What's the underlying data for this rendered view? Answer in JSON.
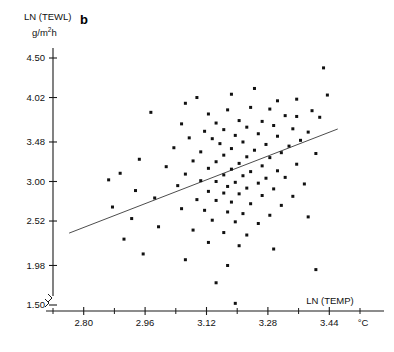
{
  "figure": {
    "panel_label": "b",
    "background_color": "#ffffff",
    "point_color": "#111111",
    "line_color": "#4d4d4d",
    "axis_color": "#1a1a1a"
  },
  "chart_data": {
    "type": "scatter",
    "title": "",
    "subtitle": "",
    "xlabel": "LN (TEMP)",
    "ylabel": "LN (TEWL)",
    "x_units": "°C",
    "y_units": "g/m²h",
    "y_units_base": "g/m",
    "y_units_exponent": "2",
    "y_units_suffix": "h",
    "grid": false,
    "legend": null,
    "xlim": [
      2.72,
      3.52
    ],
    "ylim": [
      1.5,
      4.5
    ],
    "xticks": [
      2.8,
      2.96,
      3.12,
      3.28,
      3.44
    ],
    "xtick_labels": [
      "2.80",
      "2.96",
      "3.12",
      "3.28",
      "3.44"
    ],
    "x_minor_tick_step": 0.08,
    "yticks": [
      1.5,
      1.98,
      2.52,
      3.0,
      3.48,
      4.02,
      4.5
    ],
    "ytick_labels": [
      "1.50",
      "1.98",
      "2.52",
      "3.00",
      "3.48",
      "4.02",
      "4.50"
    ],
    "axis_break": true,
    "series": [
      {
        "name": "observations",
        "marker": "square",
        "marker_size": 3,
        "points": [
          [
            3.425,
            4.38
          ],
          [
            3.245,
            4.13
          ],
          [
            3.185,
            4.06
          ],
          [
            3.435,
            4.05
          ],
          [
            3.095,
            4.02
          ],
          [
            3.355,
            4.0
          ],
          [
            3.305,
            3.98
          ],
          [
            3.065,
            3.95
          ],
          [
            3.235,
            3.9
          ],
          [
            3.285,
            3.88
          ],
          [
            3.175,
            3.87
          ],
          [
            3.395,
            3.86
          ],
          [
            2.975,
            3.84
          ],
          [
            3.125,
            3.82
          ],
          [
            3.325,
            3.8
          ],
          [
            3.355,
            3.79
          ],
          [
            3.415,
            3.78
          ],
          [
            3.205,
            3.74
          ],
          [
            3.265,
            3.73
          ],
          [
            3.145,
            3.71
          ],
          [
            3.055,
            3.7
          ],
          [
            3.295,
            3.68
          ],
          [
            3.225,
            3.66
          ],
          [
            3.345,
            3.64
          ],
          [
            3.165,
            3.63
          ],
          [
            3.115,
            3.61
          ],
          [
            3.385,
            3.6
          ],
          [
            3.255,
            3.58
          ],
          [
            3.195,
            3.56
          ],
          [
            3.305,
            3.55
          ],
          [
            3.075,
            3.53
          ],
          [
            3.135,
            3.52
          ],
          [
            3.365,
            3.5
          ],
          [
            3.215,
            3.48
          ],
          [
            3.155,
            3.46
          ],
          [
            3.275,
            3.45
          ],
          [
            3.335,
            3.43
          ],
          [
            3.035,
            3.41
          ],
          [
            3.185,
            3.4
          ],
          [
            3.245,
            3.38
          ],
          [
            3.105,
            3.36
          ],
          [
            3.315,
            3.35
          ],
          [
            3.405,
            3.34
          ],
          [
            3.165,
            3.32
          ],
          [
            3.225,
            3.3
          ],
          [
            3.285,
            3.29
          ],
          [
            2.945,
            3.27
          ],
          [
            3.085,
            3.25
          ],
          [
            3.145,
            3.24
          ],
          [
            3.205,
            3.22
          ],
          [
            3.355,
            3.21
          ],
          [
            3.265,
            3.19
          ],
          [
            3.015,
            3.18
          ],
          [
            3.125,
            3.16
          ],
          [
            3.185,
            3.15
          ],
          [
            3.305,
            3.13
          ],
          [
            3.235,
            3.12
          ],
          [
            2.895,
            3.1
          ],
          [
            3.065,
            3.09
          ],
          [
            3.165,
            3.08
          ],
          [
            3.215,
            3.07
          ],
          [
            3.325,
            3.05
          ],
          [
            3.275,
            3.04
          ],
          [
            2.865,
            3.02
          ],
          [
            3.105,
            3.01
          ],
          [
            3.145,
            3.0
          ],
          [
            3.195,
            2.99
          ],
          [
            3.255,
            2.98
          ],
          [
            3.375,
            2.97
          ],
          [
            3.045,
            2.95
          ],
          [
            3.175,
            2.94
          ],
          [
            3.225,
            2.92
          ],
          [
            3.295,
            2.91
          ],
          [
            2.935,
            2.89
          ],
          [
            3.125,
            2.88
          ],
          [
            3.165,
            2.86
          ],
          [
            3.205,
            2.85
          ],
          [
            3.265,
            2.83
          ],
          [
            3.345,
            2.82
          ],
          [
            2.985,
            2.8
          ],
          [
            3.095,
            2.78
          ],
          [
            3.145,
            2.77
          ],
          [
            3.185,
            2.75
          ],
          [
            3.235,
            2.73
          ],
          [
            3.315,
            2.71
          ],
          [
            2.875,
            2.69
          ],
          [
            3.055,
            2.67
          ],
          [
            3.115,
            2.65
          ],
          [
            3.175,
            2.63
          ],
          [
            3.215,
            2.61
          ],
          [
            3.285,
            2.59
          ],
          [
            3.385,
            2.57
          ],
          [
            2.925,
            2.55
          ],
          [
            3.135,
            2.53
          ],
          [
            3.195,
            2.51
          ],
          [
            3.255,
            2.49
          ],
          [
            2.995,
            2.45
          ],
          [
            3.085,
            2.41
          ],
          [
            3.165,
            2.38
          ],
          [
            3.225,
            2.35
          ],
          [
            2.905,
            2.3
          ],
          [
            3.125,
            2.26
          ],
          [
            3.205,
            2.22
          ],
          [
            3.295,
            2.18
          ],
          [
            2.955,
            2.12
          ],
          [
            3.065,
            2.05
          ],
          [
            3.175,
            1.98
          ],
          [
            3.405,
            1.93
          ],
          [
            3.145,
            1.77
          ],
          [
            3.195,
            1.52
          ]
        ]
      }
    ],
    "fit_line": {
      "name": "regression-line",
      "x_start": 2.762,
      "y_start": 2.373,
      "x_end": 3.462,
      "y_end": 3.638
    }
  }
}
